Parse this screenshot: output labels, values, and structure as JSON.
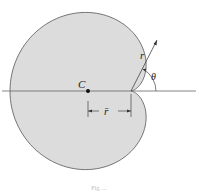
{
  "figure": {
    "shape": "cardioid",
    "fill_color": "#dcdcdc",
    "stroke_color": "#555555",
    "pole": {
      "x": 131,
      "y": 91
    },
    "a": 60.5,
    "axis": {
      "x1": 2,
      "x2": 196,
      "y": 91
    },
    "labels": {
      "centroid": "C",
      "radius": "r",
      "angle": "θ",
      "centroid_distance": "r̄"
    },
    "caption": "Fig. ..."
  }
}
